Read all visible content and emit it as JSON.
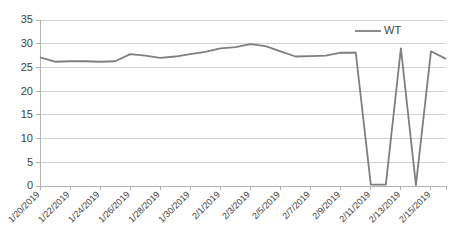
{
  "chart_data": {
    "type": "line",
    "title": "",
    "xlabel": "",
    "ylabel": "",
    "ylim": [
      0,
      35
    ],
    "ytick_values": [
      0,
      5,
      10,
      15,
      20,
      25,
      30,
      35
    ],
    "grid": true,
    "legend_position": "top-right",
    "legend": [
      "WT"
    ],
    "line_color": "#7f7f7f",
    "gridline_color": "#d0d0d0",
    "axis_color": "#b3b3b3",
    "background_color": "#ffffff",
    "x_tick_labels": [
      "1/20/2019",
      "1/22/2019",
      "1/24/2019",
      "1/26/2019",
      "1/28/2019",
      "1/30/2019",
      "2/1/2019",
      "2/3/2019",
      "2/5/2019",
      "2/7/2019",
      "2/9/2019",
      "2/11/2019",
      "2/13/2019",
      "2/15/2019"
    ],
    "x": [
      "1/20/2019",
      "1/21/2019",
      "1/22/2019",
      "1/23/2019",
      "1/24/2019",
      "1/25/2019",
      "1/26/2019",
      "1/27/2019",
      "1/28/2019",
      "1/29/2019",
      "1/30/2019",
      "1/31/2019",
      "2/1/2019",
      "2/2/2019",
      "2/3/2019",
      "2/4/2019",
      "2/5/2019",
      "2/6/2019",
      "2/7/2019",
      "2/8/2019",
      "2/9/2019",
      "2/10/2019",
      "2/11/2019",
      "2/12/2019",
      "2/13/2019",
      "2/14/2019",
      "2/15/2019",
      "2/16/2019"
    ],
    "series": [
      {
        "name": "WT",
        "values": [
          27.1,
          26.2,
          26.3,
          26.3,
          26.2,
          26.3,
          27.8,
          27.5,
          27.0,
          27.3,
          27.8,
          28.3,
          29.0,
          29.3,
          29.9,
          29.5,
          28.4,
          27.3,
          27.4,
          27.5,
          28.1,
          28.1,
          0.3,
          0.3,
          29.0,
          0.2,
          28.4,
          26.8
        ]
      }
    ]
  }
}
